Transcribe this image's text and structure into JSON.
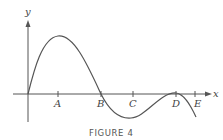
{
  "figure": {
    "caption": "FIGURE 4",
    "axes": {
      "x_label": "x",
      "y_label": "y"
    },
    "points": [
      {
        "label": "A"
      },
      {
        "label": "B"
      },
      {
        "label": "C"
      },
      {
        "label": "D"
      },
      {
        "label": "E"
      }
    ],
    "colors": {
      "curve": "#555555",
      "axes": "#555555",
      "text": "#444444"
    }
  }
}
